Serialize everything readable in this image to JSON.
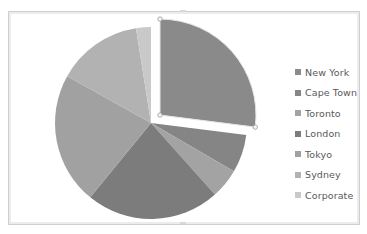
{
  "chart_data": {
    "type": "pie",
    "title": "",
    "exploded": "New York",
    "start_angle_deg": 0,
    "direction": "clockwise",
    "categories": [
      "New York",
      "Cape Town",
      "Toronto",
      "London",
      "Tokyo",
      "Sydney",
      "Corporate"
    ],
    "values": [
      27.0,
      6.4,
      5.0,
      22.5,
      22.2,
      14.4,
      2.5
    ],
    "colors": [
      "#8a8a8a",
      "#858585",
      "#a3a3a3",
      "#7c7c7c",
      "#a1a1a1",
      "#b2b2b2",
      "#c9c9c9"
    ],
    "legend_position": "right",
    "grid": false
  },
  "legend": {
    "items": [
      {
        "label": "New York",
        "color": "#8a8a8a"
      },
      {
        "label": "Cape Town",
        "color": "#858585"
      },
      {
        "label": "Toronto",
        "color": "#a3a3a3"
      },
      {
        "label": "London",
        "color": "#7c7c7c"
      },
      {
        "label": "Tokyo",
        "color": "#a1a1a1"
      },
      {
        "label": "Sydney",
        "color": "#b2b2b2"
      },
      {
        "label": "Corporate",
        "color": "#c9c9c9"
      }
    ]
  }
}
